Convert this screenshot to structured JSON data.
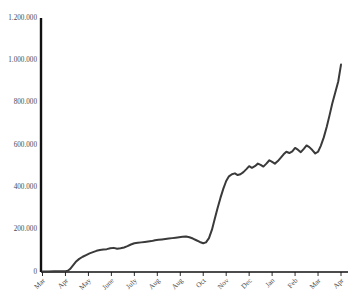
{
  "chart_data": {
    "type": "line",
    "title": "",
    "subtitle": "",
    "xlabel": "",
    "ylabel": "",
    "grid": false,
    "legend": false,
    "legend_position": "none",
    "line_color": "#3a3a3a",
    "axis_color": "#111111",
    "background": "#ffffff",
    "ylim": [
      0,
      1200000
    ],
    "y_ticks": [
      0,
      200000,
      400000,
      600000,
      800000,
      1000000,
      1200000
    ],
    "y_tick_labels": [
      "0",
      "200.000",
      "400.000",
      "600.000",
      "800.000",
      "1.000.000",
      "1.200.000"
    ],
    "categories": [
      "Mar",
      "Apr",
      "May",
      "June",
      "July",
      "Aug",
      "Aug",
      "Oct",
      "Nov",
      "Dec",
      "Jan",
      "Feb",
      "Mar",
      "Apr"
    ],
    "x_tick_labels": [
      "Mar",
      "Apr",
      "May",
      "June",
      "July",
      "Aug",
      "Aug",
      "Oct",
      "Nov",
      "Dec",
      "Jan",
      "Feb",
      "Mar",
      "Apr"
    ],
    "series": [
      {
        "name": "cumulative total",
        "x": [
          0.0,
          0.25,
          0.5,
          0.75,
          1.0,
          1.1,
          1.2,
          1.32,
          1.45,
          1.6,
          1.75,
          1.9,
          2.05,
          2.2,
          2.35,
          2.5,
          2.65,
          2.8,
          2.95,
          3.1,
          3.25,
          3.4,
          3.55,
          3.7,
          3.85,
          4.0,
          4.15,
          4.3,
          4.45,
          4.6,
          4.75,
          4.9,
          5.05,
          5.2,
          5.35,
          5.5,
          5.65,
          5.8,
          5.95,
          6.1,
          6.25,
          6.4,
          6.55,
          6.7,
          6.85,
          7.0,
          7.12,
          7.25,
          7.38,
          7.5,
          7.62,
          7.75,
          7.88,
          8.0,
          8.12,
          8.25,
          8.38,
          8.5,
          8.62,
          8.75,
          8.88,
          9.0,
          9.12,
          9.25,
          9.38,
          9.5,
          9.62,
          9.75,
          9.88,
          10.0,
          10.12,
          10.25,
          10.38,
          10.5,
          10.62,
          10.75,
          10.88,
          11.0,
          11.12,
          11.25,
          11.38,
          11.5,
          11.62,
          11.75,
          11.88,
          12.0,
          12.12,
          12.25,
          12.38,
          12.5,
          12.62,
          12.75,
          12.88,
          13.0
        ],
        "values": [
          2000,
          2500,
          3000,
          3500,
          4000,
          6000,
          14000,
          30000,
          48000,
          62000,
          72000,
          80000,
          88000,
          94000,
          100000,
          104000,
          106000,
          108000,
          112000,
          114000,
          110000,
          112000,
          116000,
          122000,
          130000,
          136000,
          138000,
          140000,
          142000,
          144000,
          146000,
          150000,
          152000,
          154000,
          156000,
          158000,
          160000,
          162000,
          164000,
          166000,
          168000,
          164000,
          158000,
          150000,
          142000,
          136000,
          140000,
          160000,
          200000,
          250000,
          300000,
          350000,
          395000,
          430000,
          452000,
          462000,
          466000,
          458000,
          462000,
          472000,
          486000,
          500000,
          492000,
          500000,
          512000,
          506000,
          498000,
          512000,
          528000,
          520000,
          512000,
          524000,
          540000,
          556000,
          568000,
          562000,
          570000,
          586000,
          578000,
          566000,
          582000,
          598000,
          590000,
          576000,
          560000,
          568000,
          596000,
          636000,
          686000,
          740000,
          796000,
          848000,
          900000,
          980000
        ]
      }
    ],
    "annotations": []
  }
}
